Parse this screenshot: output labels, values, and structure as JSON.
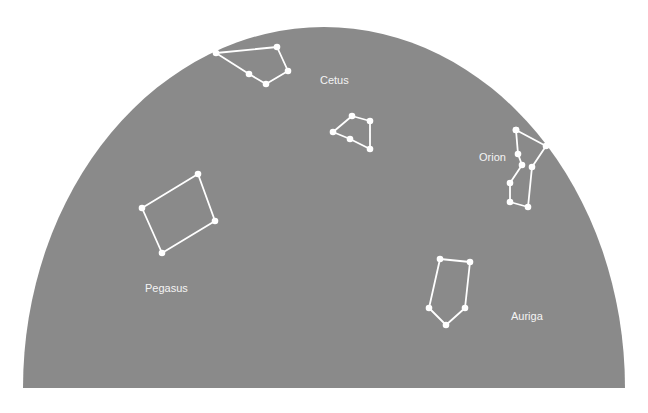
{
  "sky": {
    "color": "#8a8a8a",
    "shape": "half-ellipse",
    "center": [
      324,
      388
    ],
    "rx": 301,
    "ry": 361
  },
  "constellations": [
    {
      "name": "unlabeled-top",
      "label": "",
      "closed": true,
      "points": [
        [
          216,
          53
        ],
        [
          277,
          47
        ],
        [
          288,
          71
        ],
        [
          266,
          84
        ],
        [
          249,
          74
        ]
      ]
    },
    {
      "name": "cetus-figure",
      "label": "",
      "closed": true,
      "points": [
        [
          352,
          116
        ],
        [
          370,
          121
        ],
        [
          370,
          149
        ],
        [
          350,
          139
        ],
        [
          333,
          132
        ]
      ]
    },
    {
      "name": "orion-figure",
      "label": "",
      "closed": false,
      "points": [
        [
          516,
          130
        ],
        [
          546,
          146
        ],
        [
          532,
          167
        ],
        [
          528,
          207
        ],
        [
          510,
          202
        ],
        [
          510,
          183
        ],
        [
          522,
          165
        ],
        [
          518,
          154
        ],
        [
          516,
          130
        ]
      ]
    },
    {
      "name": "pegasus-figure",
      "label": "",
      "closed": true,
      "points": [
        [
          198,
          174
        ],
        [
          215,
          221
        ],
        [
          162,
          253
        ],
        [
          142,
          208
        ]
      ]
    },
    {
      "name": "auriga-figure",
      "label": "",
      "closed": true,
      "points": [
        [
          440,
          259
        ],
        [
          470,
          262
        ],
        [
          465,
          308
        ],
        [
          446,
          325
        ],
        [
          429,
          308
        ]
      ]
    }
  ],
  "labels": [
    {
      "text": "Cetus",
      "x": 320,
      "y": 84
    },
    {
      "text": "Orion",
      "x": 479,
      "y": 161
    },
    {
      "text": "Pegasus",
      "x": 145,
      "y": 292
    },
    {
      "text": "Auriga",
      "x": 511,
      "y": 320
    }
  ]
}
